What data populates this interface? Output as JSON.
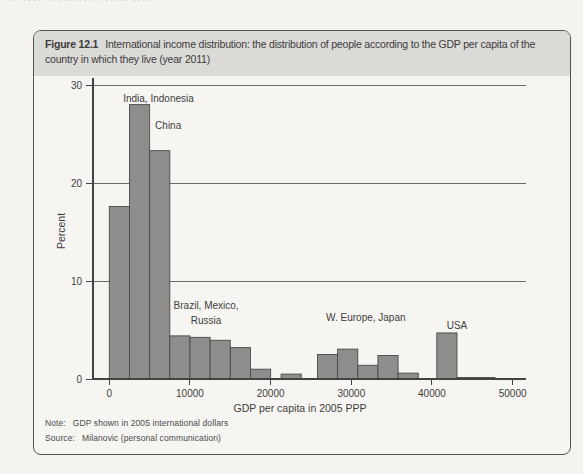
{
  "page": {
    "header_fragment": "·· ···· ·· ······ ·· ····· ····"
  },
  "figure": {
    "label": "Figure 12.1",
    "title": "International income distribution: the distribution of people according to the GDP per capita of the country in which they live (year 2011)",
    "title_lines": [
      "International income distribution: the distribution of people according to the GDP per capita of the",
      "country in which they live (year 2011)"
    ],
    "note_label": "Note:",
    "note": "GDP shown in 2005 international dollars",
    "source_label": "Source:",
    "source": "Milanovic (personal communication)"
  },
  "chart_data": {
    "type": "bar",
    "title": "International income distribution: the distribution of people according to the GDP per capita of the country in which they live (year 2011)",
    "xlabel": "GDP per capita in 2005 PPP",
    "ylabel": "Percent",
    "xlim": [
      -2000,
      51650
    ],
    "ylim": [
      0,
      31
    ],
    "x_ticks": [
      0,
      10000,
      20000,
      30000,
      40000,
      50000
    ],
    "y_ticks": [
      0,
      10,
      20,
      30
    ],
    "gridlines": [
      10,
      20,
      30
    ],
    "legend": "none",
    "bars": [
      {
        "x0": 0,
        "x1": 2500,
        "value": 17.6
      },
      {
        "x0": 2500,
        "x1": 5000,
        "value": 28.0
      },
      {
        "x0": 5000,
        "x1": 7500,
        "value": 23.3
      },
      {
        "x0": 7500,
        "x1": 10000,
        "value": 4.4
      },
      {
        "x0": 10000,
        "x1": 12500,
        "value": 4.25
      },
      {
        "x0": 12500,
        "x1": 15000,
        "value": 3.95
      },
      {
        "x0": 15000,
        "x1": 17500,
        "value": 3.2
      },
      {
        "x0": 17500,
        "x1": 20000,
        "value": 1.0
      },
      {
        "x0": 21300,
        "x1": 23800,
        "value": 0.5
      },
      {
        "x0": 25800,
        "x1": 28300,
        "value": 2.5
      },
      {
        "x0": 28300,
        "x1": 30800,
        "value": 3.05
      },
      {
        "x0": 30800,
        "x1": 33300,
        "value": 1.4
      },
      {
        "x0": 33300,
        "x1": 35800,
        "value": 2.4
      },
      {
        "x0": 35800,
        "x1": 38300,
        "value": 0.6
      },
      {
        "x0": 40600,
        "x1": 43100,
        "value": 4.7
      },
      {
        "x0": 43100,
        "x1": 47800,
        "value": 0.15
      }
    ],
    "annotations": [
      {
        "text": "India, Indonesia",
        "x": 6100,
        "y": 28.3
      },
      {
        "text": "China",
        "x": 7300,
        "y": 25.5
      },
      {
        "text": "Brazil, Mexico,",
        "x": 12000,
        "y": 7.15
      },
      {
        "text": "Russia",
        "x": 12000,
        "y": 5.6
      },
      {
        "text": "W. Europe, Japan",
        "x": 31800,
        "y": 5.9
      },
      {
        "text": "USA",
        "x": 43100,
        "y": 5.1
      }
    ],
    "colors": {
      "bar_fill": "#8e8d8b",
      "bar_stroke": "#4a4947",
      "axis": "#444341",
      "grid": "#5c5b59",
      "text": "#3e3d3b"
    }
  }
}
